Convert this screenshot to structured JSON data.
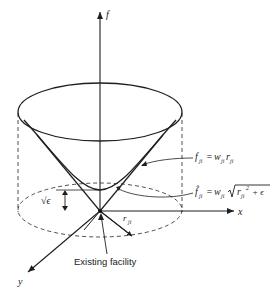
{
  "diagram": {
    "type": "3d-surface-illustration",
    "axes": {
      "vertical_label": "f",
      "x_label": "x",
      "y_label": "y"
    },
    "annotations": {
      "cone_equation": {
        "lhs": "f",
        "lhs_sub": "ji",
        "rhs_w": "w",
        "rhs_w_sub": "ji",
        "rhs_r": "r",
        "rhs_r_sub": "ji",
        "text": "f_ji = w_ji r_ji"
      },
      "hyperboloid_equation": {
        "lhs": "f̂",
        "lhs_sub": "ji",
        "rhs_w": "w",
        "rhs_w_sub": "ji",
        "rhs_r": "r",
        "rhs_r_sub": "ji",
        "rhs_exp": "2",
        "rhs_plus": "+ ϵ",
        "text": "f̂_ji = w_ji √(r_ji² + ϵ)"
      },
      "offset_label": "√ϵ",
      "radius_label": "r",
      "radius_label_sub": "ji",
      "facility_label": "Existing facility"
    }
  }
}
